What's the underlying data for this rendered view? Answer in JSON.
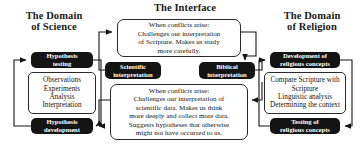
{
  "diagram": {
    "headers": {
      "science": "The Domain\nof Science",
      "interface": "The Interface",
      "religion": "The Domain\nof Religion"
    },
    "science_cycle": {
      "top": "Hypothesis\ntesting",
      "middle": "Observations\nExperiments\nAnalysis\nInterpretation",
      "bottom": "Hypothesis\ndevelopment"
    },
    "religion_cycle": {
      "top": "Development of\nreligious concepts",
      "middle": "Compare Scripture with\nScripture\nLinguistic analysis\nDetermining the context",
      "bottom": "Testing of\nreligious concepts"
    },
    "interface": {
      "scientific_interpretation": "Scientific\ninterpretation",
      "biblical_interpretation": "Biblical\ninterpretation",
      "top_panel": "When conflicts arise:\nChallenges our interpretation\nof Scripture. Makes us study\nmore carefully.",
      "bottom_panel": "When conflicts arise:\nChallenges our interpretation of\nscientific data. Makes us think\nmore deeply and collect more data.\nSuggests hypotheses that otherwise\nmight not have occurred to us."
    },
    "colors": {
      "background": "#ffffff",
      "block_fill": "#141414",
      "block_text": "#ffffff",
      "panel_fill": "#ffffff",
      "stroke": "#2a2a2a",
      "heading": "#1a1a1a"
    }
  }
}
